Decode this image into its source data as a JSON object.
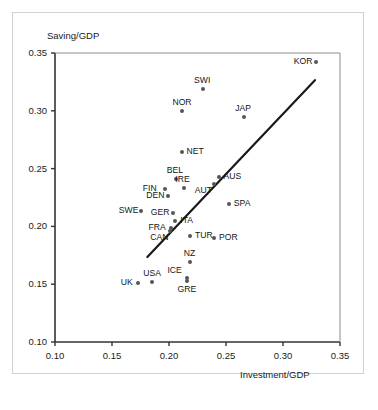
{
  "chart_data": {
    "type": "scatter",
    "title": "",
    "xlabel": "Investment/GDP",
    "ylabel": "Saving/GDP",
    "xlim": [
      0.1,
      0.35
    ],
    "ylim": [
      0.1,
      0.35
    ],
    "xticks": [
      "0.10",
      "0.15",
      "0.20",
      "0.25",
      "0.30",
      "0.35"
    ],
    "yticks": [
      "0.10",
      "0.15",
      "0.20",
      "0.25",
      "0.30",
      "0.35"
    ],
    "xtick_values": [
      0.1,
      0.15,
      0.2,
      0.25,
      0.3,
      0.35
    ],
    "ytick_values": [
      0.1,
      0.15,
      0.2,
      0.25,
      0.3,
      0.35
    ],
    "grid": false,
    "legend": "none",
    "marker_color": "#555555",
    "line_color": "#1a1a1a",
    "frame_color": "#333333",
    "trendline": {
      "label": "regression-line",
      "x": [
        0.181,
        0.328
      ],
      "y": [
        0.1735,
        0.3265
      ]
    },
    "points": [
      {
        "label": "KOR",
        "x": 0.329,
        "y": 0.3425,
        "label_side": "left"
      },
      {
        "label": "SWI",
        "x": 0.23,
        "y": 0.3185,
        "label_side": "above"
      },
      {
        "label": "NOR",
        "x": 0.211,
        "y": 0.2995,
        "label_side": "above"
      },
      {
        "label": "JAP",
        "x": 0.266,
        "y": 0.2945,
        "label_side": "above"
      },
      {
        "label": "NET",
        "x": 0.211,
        "y": 0.264,
        "label_side": "right"
      },
      {
        "label": "BEL",
        "x": 0.206,
        "y": 0.241,
        "label_side": "above"
      },
      {
        "label": "AUS",
        "x": 0.2435,
        "y": 0.243,
        "label_side": "right"
      },
      {
        "label": "IRE",
        "x": 0.2135,
        "y": 0.2335,
        "label_side": "above"
      },
      {
        "label": "FIN",
        "x": 0.1965,
        "y": 0.232,
        "label_side": "left"
      },
      {
        "label": "AUT",
        "x": 0.2395,
        "y": 0.2365,
        "label_side": "below-left"
      },
      {
        "label": "DEN",
        "x": 0.1995,
        "y": 0.2265,
        "label_side": "left"
      },
      {
        "label": "SPA",
        "x": 0.2525,
        "y": 0.2195,
        "label_side": "right"
      },
      {
        "label": "SWE",
        "x": 0.1755,
        "y": 0.213,
        "label_side": "left"
      },
      {
        "label": "GER",
        "x": 0.2035,
        "y": 0.2115,
        "label_side": "left"
      },
      {
        "label": "ITA",
        "x": 0.2055,
        "y": 0.2045,
        "label_side": "right"
      },
      {
        "label": "FRA",
        "x": 0.2015,
        "y": 0.1985,
        "label_side": "left"
      },
      {
        "label": "CAN",
        "x": 0.2005,
        "y": 0.196,
        "label_side": "below-left"
      },
      {
        "label": "TUR",
        "x": 0.2185,
        "y": 0.192,
        "label_side": "right"
      },
      {
        "label": "POR",
        "x": 0.2395,
        "y": 0.19,
        "label_side": "right"
      },
      {
        "label": "NZ",
        "x": 0.2185,
        "y": 0.169,
        "label_side": "above"
      },
      {
        "label": "ICE",
        "x": 0.2155,
        "y": 0.1555,
        "label_side": "above-left"
      },
      {
        "label": "GRE",
        "x": 0.2155,
        "y": 0.1525,
        "label_side": "below"
      },
      {
        "label": "USA",
        "x": 0.1855,
        "y": 0.152,
        "label_side": "above"
      },
      {
        "label": "UK",
        "x": 0.1725,
        "y": 0.151,
        "label_side": "left"
      }
    ]
  }
}
